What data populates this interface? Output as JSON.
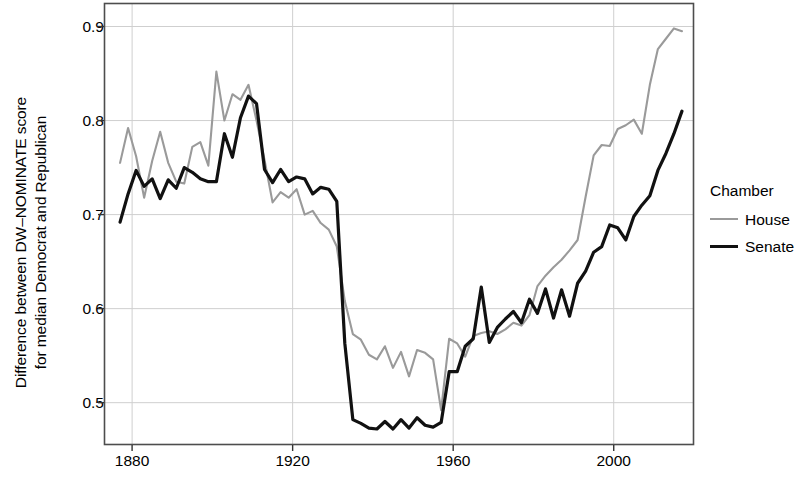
{
  "chart_data": {
    "type": "line",
    "title": "",
    "subtitle": "",
    "xlabel": "",
    "ylabel": "Difference between DW–NOMINATE score for median Democrat and Republican",
    "ylabel_line1": "Difference between DW–NOMINATE score",
    "ylabel_line2": "for median Democrat and Republican",
    "xlim": [
      1873,
      2020
    ],
    "ylim": [
      0.455,
      0.925
    ],
    "xticks": [
      1880,
      1920,
      1960,
      2000
    ],
    "xtick_labels": [
      "1880",
      "1920",
      "1960",
      "2000"
    ],
    "yticks": [
      0.5,
      0.6,
      0.7,
      0.8,
      0.9
    ],
    "ytick_labels": [
      "0.5",
      "0.6",
      "0.7",
      "0.8",
      "0.9"
    ],
    "grid": true,
    "legend_position": "right",
    "legend_title": "Chamber",
    "colors": {
      "House": "#9a9a9a",
      "Senate": "#111111",
      "grid": "#cfcfcf",
      "panel_border": "#4d4d4d",
      "background": "#ffffff"
    },
    "series": [
      {
        "name": "House",
        "color": "#9a9a9a",
        "x": [
          1877,
          1879,
          1881,
          1883,
          1885,
          1887,
          1889,
          1891,
          1893,
          1895,
          1897,
          1899,
          1901,
          1903,
          1905,
          1907,
          1909,
          1911,
          1913,
          1915,
          1917,
          1919,
          1921,
          1923,
          1925,
          1927,
          1929,
          1931,
          1933,
          1935,
          1937,
          1939,
          1941,
          1943,
          1945,
          1947,
          1949,
          1951,
          1953,
          1955,
          1957,
          1959,
          1961,
          1963,
          1965,
          1967,
          1969,
          1971,
          1973,
          1975,
          1977,
          1979,
          1981,
          1983,
          1985,
          1987,
          1989,
          1991,
          1993,
          1995,
          1997,
          1999,
          2001,
          2003,
          2005,
          2007,
          2009,
          2011,
          2013,
          2015,
          2017
        ],
        "y": [
          0.755,
          0.792,
          0.762,
          0.718,
          0.757,
          0.788,
          0.755,
          0.735,
          0.733,
          0.772,
          0.777,
          0.752,
          0.852,
          0.8,
          0.828,
          0.822,
          0.838,
          0.8,
          0.758,
          0.713,
          0.724,
          0.718,
          0.727,
          0.7,
          0.704,
          0.691,
          0.684,
          0.666,
          0.608,
          0.573,
          0.567,
          0.551,
          0.546,
          0.56,
          0.537,
          0.554,
          0.528,
          0.556,
          0.553,
          0.546,
          0.492,
          0.568,
          0.563,
          0.549,
          0.571,
          0.574,
          0.576,
          0.573,
          0.578,
          0.585,
          0.582,
          0.593,
          0.624,
          0.635,
          0.644,
          0.652,
          0.662,
          0.673,
          0.719,
          0.763,
          0.774,
          0.773,
          0.791,
          0.795,
          0.801,
          0.786,
          0.838,
          0.876,
          0.887,
          0.898,
          0.895
        ]
      },
      {
        "name": "Senate",
        "color": "#111111",
        "x": [
          1877,
          1879,
          1881,
          1883,
          1885,
          1887,
          1889,
          1891,
          1893,
          1895,
          1897,
          1899,
          1901,
          1903,
          1905,
          1907,
          1909,
          1911,
          1913,
          1915,
          1917,
          1919,
          1921,
          1923,
          1925,
          1927,
          1929,
          1931,
          1933,
          1935,
          1937,
          1939,
          1941,
          1943,
          1945,
          1947,
          1949,
          1951,
          1953,
          1955,
          1957,
          1959,
          1961,
          1963,
          1965,
          1967,
          1969,
          1971,
          1973,
          1975,
          1977,
          1979,
          1981,
          1983,
          1985,
          1987,
          1989,
          1991,
          1993,
          1995,
          1997,
          1999,
          2001,
          2003,
          2005,
          2007,
          2009,
          2011,
          2013,
          2015,
          2017
        ],
        "y": [
          0.692,
          0.722,
          0.747,
          0.73,
          0.738,
          0.717,
          0.737,
          0.728,
          0.75,
          0.745,
          0.738,
          0.735,
          0.735,
          0.786,
          0.761,
          0.803,
          0.826,
          0.818,
          0.748,
          0.734,
          0.748,
          0.735,
          0.74,
          0.738,
          0.722,
          0.729,
          0.727,
          0.714,
          0.563,
          0.482,
          0.478,
          0.473,
          0.472,
          0.48,
          0.472,
          0.482,
          0.473,
          0.484,
          0.476,
          0.474,
          0.479,
          0.533,
          0.533,
          0.56,
          0.568,
          0.623,
          0.564,
          0.58,
          0.589,
          0.597,
          0.585,
          0.61,
          0.595,
          0.621,
          0.59,
          0.62,
          0.592,
          0.627,
          0.64,
          0.66,
          0.666,
          0.689,
          0.686,
          0.673,
          0.698,
          0.71,
          0.72,
          0.747,
          0.765,
          0.786,
          0.81
        ]
      }
    ]
  },
  "legend": {
    "title": "Chamber",
    "items": [
      {
        "label": "House",
        "color": "#9a9a9a"
      },
      {
        "label": "Senate",
        "color": "#111111"
      }
    ]
  }
}
